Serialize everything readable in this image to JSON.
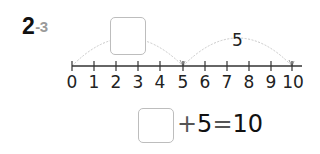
{
  "problem": {
    "number": "2",
    "sub_number": "-3"
  },
  "number_line": {
    "min": 0,
    "max": 10,
    "ticks": [
      "0",
      "1",
      "2",
      "3",
      "4",
      "5",
      "6",
      "7",
      "8",
      "9",
      "10"
    ],
    "jumps": [
      {
        "from": 0,
        "to": 5,
        "label": "",
        "answer_box": true
      },
      {
        "from": 5,
        "to": 10,
        "label": "5",
        "answer_box": false
      }
    ],
    "colors": {
      "axis": "#333333",
      "arc": "#c8c8c8",
      "box_border": "#bdbdbd"
    }
  },
  "equation": {
    "blank": "",
    "plus": "+",
    "addend": "5",
    "equals": "=",
    "result": "10"
  }
}
